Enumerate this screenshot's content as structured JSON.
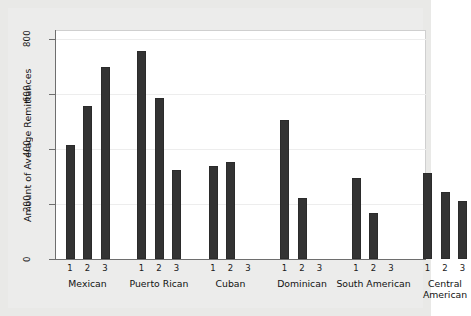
{
  "chart_data": {
    "type": "bar",
    "title": "",
    "xlabel": "",
    "ylabel": "Amount of Average Remittances",
    "ylim": [
      0,
      880
    ],
    "yticks": [
      0,
      200,
      400,
      600,
      800
    ],
    "ytick_labels": [
      "0",
      "200",
      "400",
      "600",
      "800"
    ],
    "grid": true,
    "legend": "none",
    "bar_color": "#333333",
    "background_color": "#ececeb",
    "plot_background_color": "#ffffff",
    "groups": [
      {
        "name": "Mexican",
        "subcategories": [
          "1",
          "2",
          "3"
        ],
        "values": [
          413,
          558,
          697
        ]
      },
      {
        "name": "Puerto Rican",
        "subcategories": [
          "1",
          "2",
          "3"
        ],
        "values": [
          755,
          585,
          325
        ]
      },
      {
        "name": "Cuban",
        "subcategories": [
          "1",
          "2",
          "3"
        ],
        "values": [
          340,
          352,
          null
        ]
      },
      {
        "name": "Dominican",
        "subcategories": [
          "1",
          "2",
          "3"
        ],
        "values": [
          505,
          222,
          null
        ]
      },
      {
        "name": "South American",
        "subcategories": [
          "1",
          "2",
          "3"
        ],
        "values": [
          295,
          168,
          null
        ]
      },
      {
        "name": "Central American",
        "subcategories": [
          "1",
          "2",
          "3"
        ],
        "values": [
          312,
          243,
          211
        ]
      }
    ]
  }
}
